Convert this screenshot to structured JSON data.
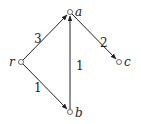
{
  "diagram": {
    "type": "directed-weighted-graph",
    "nodes": [
      {
        "id": "r",
        "label": "r",
        "x": 21,
        "y": 62,
        "label_x": 9,
        "label_y": 66
      },
      {
        "id": "a",
        "label": "a",
        "x": 70,
        "y": 12,
        "label_x": 75,
        "label_y": 16
      },
      {
        "id": "b",
        "label": "b",
        "x": 70,
        "y": 112,
        "label_x": 75,
        "label_y": 116
      },
      {
        "id": "c",
        "label": "c",
        "x": 119,
        "y": 62,
        "label_x": 124,
        "label_y": 66
      }
    ],
    "edges": [
      {
        "from": "r",
        "to": "a",
        "weight": "3",
        "weight_x": 35,
        "weight_y": 42
      },
      {
        "from": "a",
        "to": "c",
        "weight": "2",
        "weight_x": 101,
        "weight_y": 46
      },
      {
        "from": "b",
        "to": "a",
        "weight": "1",
        "weight_x": 77,
        "weight_y": 68
      },
      {
        "from": "r",
        "to": "b",
        "weight": "1",
        "weight_x": 35,
        "weight_y": 90
      }
    ]
  }
}
